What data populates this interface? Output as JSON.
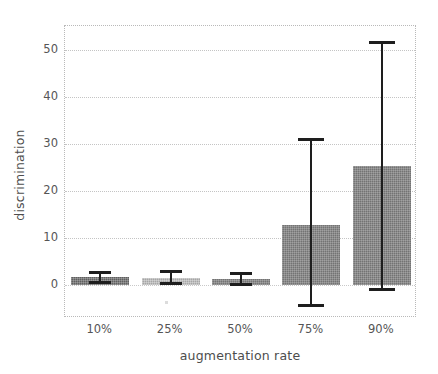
{
  "chart_data": {
    "type": "bar",
    "title": "",
    "xlabel": "augmentation rate",
    "ylabel": "discrimination",
    "categories": [
      "10%",
      "25%",
      "50%",
      "75%",
      "90%"
    ],
    "values": [
      1.7,
      1.5,
      1.3,
      12.7,
      25.3
    ],
    "error_upper": [
      2.8,
      3.0,
      2.5,
      31.0,
      51.5
    ],
    "error_lower": [
      0.6,
      0.5,
      0.2,
      -4.3,
      -0.9
    ],
    "ylim": [
      -7.0,
      55.0
    ],
    "yticks": [
      0,
      10,
      20,
      30,
      40,
      50
    ],
    "ytick_labels": [
      "0",
      "10",
      "20",
      "30",
      "40",
      "50"
    ],
    "xtick_labels": [
      "10%",
      "25%",
      "50%",
      "75%",
      "90%"
    ],
    "grid": true,
    "grid_axis": "y",
    "legend": "none",
    "bar_colors": [
      "#5f5f5f",
      "#a6a6a6",
      "#737373",
      "#737373",
      "#6b6b6b"
    ],
    "error_color": "#1e1e1e",
    "background": "#ffffff",
    "axis_color": "#b9b9b9"
  }
}
